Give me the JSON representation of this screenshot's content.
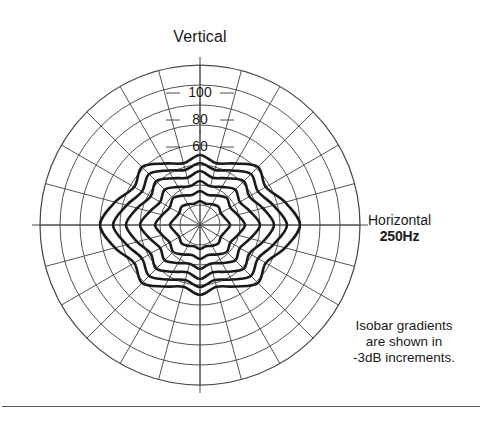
{
  "figure": {
    "vertical_axis_label": "Vertical",
    "horizontal_axis_label": "Horizontal",
    "frequency_label": "250Hz",
    "note_line_1": "Isobar gradients",
    "note_line_2": "are shown in",
    "note_line_3": "-3dB increments."
  },
  "ticks": {
    "t100": "100",
    "t80": "80",
    "t60": "60"
  },
  "colors": {
    "grid": "#4a4a4a",
    "contour": "#1a1a1a",
    "text": "#1a1a1a",
    "divider": "#5a5a5a",
    "background": "#ffffff"
  },
  "chart_data": {
    "type": "line",
    "subtype": "polar-isobar",
    "title": "",
    "xlabel": "Horizontal",
    "ylabel": "Vertical",
    "legend_position": "none",
    "grid": true,
    "annotations": [
      "Vertical",
      "Horizontal",
      "250Hz",
      "Isobar gradients are shown in -3dB increments."
    ],
    "polar": {
      "center_px": [
        200,
        225
      ],
      "outer_radius_px": 160,
      "ring_count": 8,
      "spoke_count": 24,
      "spoke_step_deg": 15,
      "angle_zero_at": "top",
      "radial_tick_labels": [
        "60",
        "80",
        "100"
      ],
      "radial_tick_radius_px": [
        78,
        105,
        132
      ],
      "radial_axis_units": "degrees off-axis"
    },
    "series": [
      {
        "name": "-3dB",
        "increment_db": -3,
        "angles_deg": [
          0,
          15,
          30,
          45,
          60,
          75,
          90,
          105,
          120,
          135,
          150,
          165,
          180,
          195,
          210,
          225,
          240,
          255,
          270,
          285,
          300,
          315,
          330,
          345
        ],
        "radii_px": [
          24,
          22,
          24,
          26,
          24,
          26,
          30,
          26,
          24,
          26,
          24,
          22,
          24,
          22,
          24,
          26,
          24,
          26,
          30,
          26,
          24,
          26,
          24,
          22
        ]
      },
      {
        "name": "-6dB",
        "increment_db": -6,
        "angles_deg": [
          0,
          15,
          30,
          45,
          60,
          75,
          90,
          105,
          120,
          135,
          150,
          165,
          180,
          195,
          210,
          225,
          240,
          255,
          270,
          285,
          300,
          315,
          330,
          345
        ],
        "radii_px": [
          34,
          31,
          34,
          38,
          35,
          39,
          45,
          39,
          35,
          38,
          34,
          31,
          34,
          31,
          34,
          38,
          35,
          39,
          45,
          39,
          35,
          38,
          34,
          31
        ]
      },
      {
        "name": "-9dB",
        "increment_db": -9,
        "angles_deg": [
          0,
          15,
          30,
          45,
          60,
          75,
          90,
          105,
          120,
          135,
          150,
          165,
          180,
          195,
          210,
          225,
          240,
          255,
          270,
          285,
          300,
          315,
          330,
          345
        ],
        "radii_px": [
          44,
          40,
          44,
          50,
          46,
          52,
          60,
          52,
          46,
          50,
          44,
          40,
          44,
          40,
          44,
          50,
          46,
          52,
          60,
          52,
          46,
          50,
          44,
          40
        ]
      },
      {
        "name": "-12dB",
        "increment_db": -12,
        "angles_deg": [
          0,
          15,
          30,
          45,
          60,
          75,
          90,
          105,
          120,
          135,
          150,
          165,
          180,
          195,
          210,
          225,
          240,
          255,
          270,
          285,
          300,
          315,
          330,
          345
        ],
        "radii_px": [
          54,
          49,
          54,
          62,
          57,
          65,
          74,
          65,
          57,
          62,
          54,
          49,
          54,
          49,
          54,
          62,
          57,
          65,
          74,
          65,
          57,
          62,
          54,
          49
        ]
      },
      {
        "name": "-15dB",
        "increment_db": -15,
        "angles_deg": [
          0,
          15,
          30,
          45,
          60,
          75,
          90,
          105,
          120,
          135,
          150,
          165,
          180,
          195,
          210,
          225,
          240,
          255,
          270,
          285,
          300,
          315,
          330,
          345
        ],
        "radii_px": [
          62,
          57,
          63,
          72,
          67,
          76,
          87,
          76,
          67,
          72,
          63,
          57,
          62,
          57,
          63,
          72,
          67,
          76,
          87,
          76,
          67,
          72,
          63,
          57
        ]
      },
      {
        "name": "-18dB",
        "increment_db": -18,
        "angles_deg": [
          0,
          15,
          30,
          45,
          60,
          75,
          90,
          105,
          120,
          135,
          150,
          165,
          180,
          195,
          210,
          225,
          240,
          255,
          270,
          285,
          300,
          315,
          330,
          345
        ],
        "radii_px": [
          70,
          64,
          71,
          82,
          76,
          88,
          100,
          88,
          76,
          82,
          71,
          64,
          70,
          64,
          71,
          82,
          76,
          88,
          100,
          88,
          76,
          82,
          71,
          64
        ]
      }
    ]
  }
}
